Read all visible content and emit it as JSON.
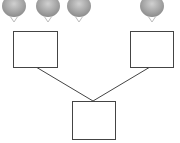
{
  "diagram": {
    "type": "tree-merge",
    "colors": {
      "stroke": "#444444",
      "bulb": "#9a9a9a",
      "bulb_light": "#c4c4c4",
      "background": "#ffffff"
    },
    "top_items": [
      {
        "name": "bulb-1",
        "cx": 14
      },
      {
        "name": "bulb-2",
        "cx": 48
      },
      {
        "name": "bulb-3",
        "cx": 79
      },
      {
        "name": "bulb-4",
        "cx": 152
      }
    ],
    "boxes": [
      {
        "name": "left-box",
        "label": ""
      },
      {
        "name": "right-box",
        "label": ""
      },
      {
        "name": "bottom-box",
        "label": ""
      }
    ]
  }
}
